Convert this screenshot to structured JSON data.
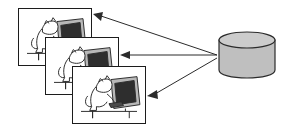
{
  "diagram": {
    "title": "Client workstations connected to a central database",
    "background_color": "#ffffff",
    "stroke_color": "#1c1c1c",
    "clients": [
      {
        "id": "client-1",
        "label": "Workstation 1",
        "caption": "Cat using a computer",
        "frame_fill": "#ffffff",
        "monitor_screen_color": "#2e2e2e",
        "monitor_case_color": "#b8b8b8"
      },
      {
        "id": "client-2",
        "label": "Workstation 2",
        "caption": "Cat using a computer",
        "frame_fill": "#ffffff",
        "monitor_screen_color": "#2e2e2e",
        "monitor_case_color": "#b8b8b8"
      },
      {
        "id": "client-3",
        "label": "Workstation 3",
        "caption": "Cat using a computer",
        "frame_fill": "#ffffff",
        "monitor_screen_color": "#2e2e2e",
        "monitor_case_color": "#b8b8b8"
      }
    ],
    "database": {
      "id": "database-cylinder",
      "label": "Database",
      "fill_color": "#bfbfbf",
      "top_fill_color": "#cccccc",
      "stroke_color": "#2b2b2b"
    },
    "connections": [
      {
        "id": "link-db-to-client-1",
        "from": "database",
        "to": "client-1",
        "direction": "to-client",
        "arrowhead": "left"
      },
      {
        "id": "link-db-to-client-2",
        "from": "database",
        "to": "client-2",
        "direction": "to-client",
        "arrowhead": "left"
      },
      {
        "id": "link-db-to-client-3",
        "from": "database",
        "to": "client-3",
        "direction": "to-client",
        "arrowhead": "left"
      }
    ]
  }
}
